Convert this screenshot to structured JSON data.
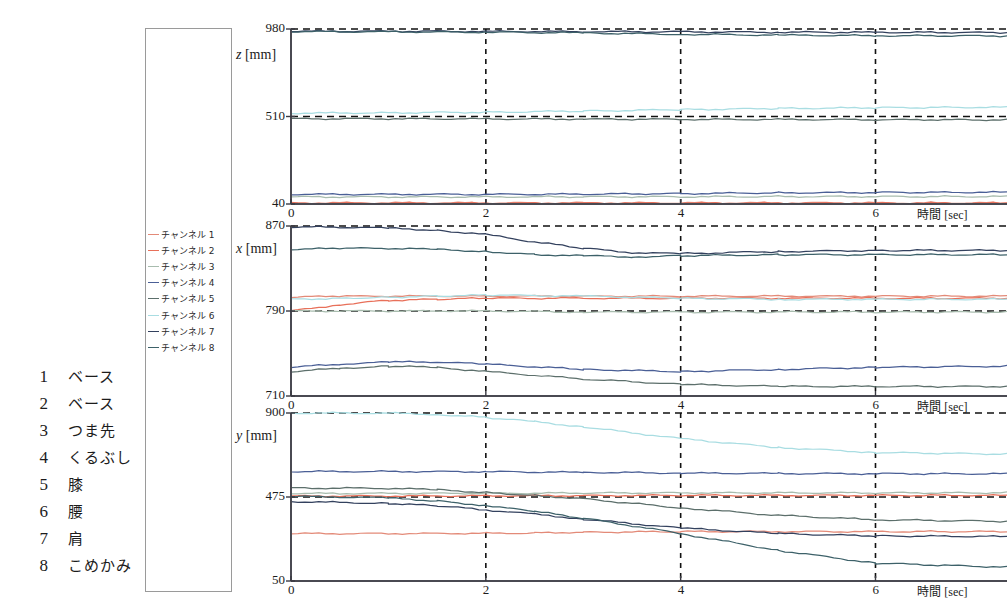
{
  "body_parts": {
    "title": "",
    "items": [
      {
        "num": "1",
        "label": "ベース"
      },
      {
        "num": "2",
        "label": "ベース"
      },
      {
        "num": "3",
        "label": "つま先"
      },
      {
        "num": "4",
        "label": "くるぶし"
      },
      {
        "num": "5",
        "label": "膝"
      },
      {
        "num": "6",
        "label": "腰"
      },
      {
        "num": "7",
        "label": "肩"
      },
      {
        "num": "8",
        "label": "こめかみ"
      }
    ]
  },
  "legend": {
    "entries": [
      {
        "label": "チャンネル 1",
        "color": "#e38a78"
      },
      {
        "label": "チャンネル 2",
        "color": "#e8705a"
      },
      {
        "label": "チャンネル 3",
        "color": "#a8bcae"
      },
      {
        "label": "チャンネル 4",
        "color": "#4a5f96"
      },
      {
        "label": "チャンネル 5",
        "color": "#5c6f6b"
      },
      {
        "label": "チャンネル 6",
        "color": "#a9dde2"
      },
      {
        "label": "チャンネル 7",
        "color": "#33415e"
      },
      {
        "label": "チャンネル 8",
        "color": "#3d6169"
      }
    ]
  },
  "chart_data": [
    {
      "id": "z-chart",
      "type": "line",
      "title": "",
      "ylabel": "z [mm]",
      "ylabel_sym": "z",
      "ylabel_unit": "[mm]",
      "xlabel_jp": "時間",
      "xlabel_unit": "[sec]",
      "xlim": [
        0,
        7.35
      ],
      "ylim": [
        40,
        980
      ],
      "yticks": [
        40,
        510,
        980
      ],
      "xticks": [
        0,
        2,
        4,
        6
      ],
      "grid": "dashed",
      "series": [
        {
          "name": "チャンネル 1",
          "color": "#e38a78",
          "x": [
            0,
            1,
            2,
            3,
            4,
            5,
            6,
            7.35
          ],
          "values": [
            46,
            46,
            46,
            46,
            46,
            46,
            46,
            46
          ]
        },
        {
          "name": "チャンネル 2",
          "color": "#e8705a",
          "x": [
            0,
            1,
            2,
            3,
            4,
            5,
            6,
            7.35
          ],
          "values": [
            44,
            44,
            44,
            44,
            44,
            44,
            44,
            44
          ]
        },
        {
          "name": "チャンネル 3",
          "color": "#a8bcae",
          "x": [
            0,
            1,
            2,
            3,
            4,
            5,
            6,
            7.35
          ],
          "values": [
            78,
            78,
            78,
            79,
            79,
            80,
            80,
            80
          ]
        },
        {
          "name": "チャンネル 4",
          "color": "#4a5f96",
          "x": [
            0,
            1,
            2,
            3,
            4,
            5,
            6,
            7.35
          ],
          "values": [
            92,
            92,
            92,
            93,
            96,
            100,
            102,
            103
          ]
        },
        {
          "name": "チャンネル 5",
          "color": "#5c6f6b",
          "x": [
            0,
            1,
            2,
            3,
            4,
            5,
            6,
            7.35
          ],
          "values": [
            498,
            498,
            497,
            496,
            495,
            494,
            493,
            492
          ]
        },
        {
          "name": "チャンネル 6",
          "color": "#a9dde2",
          "x": [
            0,
            1,
            2,
            3,
            4,
            5,
            6,
            7.35
          ],
          "values": [
            528,
            530,
            533,
            539,
            547,
            553,
            557,
            560
          ]
        },
        {
          "name": "チャンネル 7",
          "color": "#33415e",
          "x": [
            0,
            1,
            2,
            3,
            4,
            5,
            6,
            7.35
          ],
          "values": [
            968,
            968,
            967,
            966,
            965,
            963,
            962,
            961
          ]
        },
        {
          "name": "チャンネル 8",
          "color": "#3d6169",
          "x": [
            0,
            1,
            2,
            3,
            4,
            5,
            6,
            7.35
          ],
          "values": [
            966,
            965,
            963,
            959,
            952,
            947,
            944,
            943
          ]
        }
      ]
    },
    {
      "id": "x-chart",
      "type": "line",
      "title": "",
      "ylabel": "x [mm]",
      "ylabel_sym": "x",
      "ylabel_unit": "[mm]",
      "xlabel_jp": "時間",
      "xlabel_unit": "[sec]",
      "xlim": [
        0,
        7.35
      ],
      "ylim": [
        710,
        870
      ],
      "yticks": [
        710,
        790,
        870
      ],
      "xticks": [
        0,
        2,
        4,
        6
      ],
      "grid": "dashed",
      "series": [
        {
          "name": "チャンネル 1",
          "color": "#e38a78",
          "x": [
            0,
            0.5,
            1,
            1.5,
            2,
            3,
            4,
            5,
            6,
            7.35
          ],
          "values": [
            803,
            804,
            804,
            804,
            804,
            804,
            804,
            804,
            804,
            804
          ]
        },
        {
          "name": "チャンネル 2",
          "color": "#e8705a",
          "x": [
            0,
            0.5,
            1,
            1.5,
            2,
            3,
            4,
            5,
            6,
            7.35
          ],
          "values": [
            790,
            796,
            800,
            801,
            802,
            802,
            802,
            802,
            802,
            802
          ]
        },
        {
          "name": "チャンネル 3",
          "color": "#a8bcae",
          "x": [
            0,
            1,
            2,
            3,
            4,
            5,
            6,
            7.35
          ],
          "values": [
            790,
            790,
            790,
            789,
            789,
            789,
            789,
            789
          ]
        },
        {
          "name": "チャンネル 4",
          "color": "#4a5f96",
          "x": [
            0,
            0.5,
            1,
            1.5,
            2,
            3,
            4,
            5,
            6,
            7.35
          ],
          "values": [
            737,
            740,
            742,
            742,
            740,
            735,
            733,
            735,
            737,
            738
          ]
        },
        {
          "name": "チャンネル 5",
          "color": "#5c6f6b",
          "x": [
            0,
            0.5,
            1,
            1.5,
            2,
            3,
            4,
            5,
            6,
            7.35
          ],
          "values": [
            733,
            736,
            738,
            737,
            733,
            726,
            721,
            719,
            719,
            719
          ]
        },
        {
          "name": "チャンネル 6",
          "color": "#a9dde2",
          "x": [
            0,
            0.5,
            1,
            1.5,
            2,
            3,
            4,
            5,
            6,
            7.35
          ],
          "values": [
            801,
            802,
            803,
            804,
            805,
            804,
            802,
            801,
            801,
            801
          ]
        },
        {
          "name": "チャンネル 7",
          "color": "#33415e",
          "x": [
            0,
            0.5,
            1,
            1.5,
            2,
            2.5,
            3,
            3.5,
            4,
            5,
            6,
            7.35
          ],
          "values": [
            869,
            869,
            868,
            866,
            862,
            855,
            849,
            845,
            844,
            846,
            847,
            847
          ]
        },
        {
          "name": "チャンネル 8",
          "color": "#3d6169",
          "x": [
            0,
            0.5,
            1,
            1.5,
            2,
            2.5,
            3,
            3.5,
            4,
            5,
            6,
            7.35
          ],
          "values": [
            848,
            849,
            849,
            848,
            846,
            843,
            842,
            841,
            842,
            843,
            843,
            843
          ]
        }
      ]
    },
    {
      "id": "y-chart",
      "type": "line",
      "title": "",
      "ylabel": "y [mm]",
      "ylabel_sym": "y",
      "ylabel_unit": "[mm]",
      "xlabel_jp": "時間",
      "xlabel_unit": "[sec]",
      "xlim": [
        0,
        7.35
      ],
      "ylim": [
        50,
        900
      ],
      "yticks": [
        50,
        475,
        900
      ],
      "xticks": [
        0,
        2,
        4,
        6
      ],
      "grid": "dashed",
      "series": [
        {
          "name": "チャンネル 1",
          "color": "#e38a78",
          "x": [
            0,
            1,
            2,
            2.5,
            3,
            4,
            5,
            6,
            7.35
          ],
          "values": [
            290,
            290,
            291,
            293,
            297,
            300,
            300,
            300,
            300
          ]
        },
        {
          "name": "チャンネル 2",
          "color": "#e8705a",
          "x": [
            0,
            1,
            2,
            3,
            4,
            5,
            6,
            7.35
          ],
          "values": [
            480,
            480,
            481,
            482,
            483,
            483,
            483,
            483
          ]
        },
        {
          "name": "チャンネル 3",
          "color": "#a8bcae",
          "x": [
            0,
            1,
            2,
            3,
            4,
            5,
            6,
            7.35
          ],
          "values": [
            493,
            493,
            494,
            495,
            496,
            496,
            496,
            496
          ]
        },
        {
          "name": "チャンネル 4",
          "color": "#4a5f96",
          "x": [
            0,
            1,
            2,
            3,
            4,
            5,
            6,
            7.35
          ],
          "values": [
            604,
            604,
            603,
            600,
            596,
            594,
            593,
            592
          ]
        },
        {
          "name": "チャンネル 5",
          "color": "#5c6f6b",
          "x": [
            0,
            0.5,
            1,
            1.5,
            2,
            2.5,
            3,
            4,
            5,
            6,
            7.35
          ],
          "values": [
            520,
            520,
            519,
            512,
            498,
            483,
            466,
            420,
            382,
            360,
            352
          ]
        },
        {
          "name": "チャンネル 6",
          "color": "#a9dde2",
          "x": [
            0,
            1,
            1.5,
            2,
            2.5,
            3,
            4,
            5,
            6,
            7.35
          ],
          "values": [
            900,
            899,
            893,
            878,
            856,
            830,
            770,
            726,
            700,
            692
          ]
        },
        {
          "name": "チャンネル 7",
          "color": "#33415e",
          "x": [
            0,
            1,
            1.5,
            2,
            2.5,
            3,
            4,
            5,
            6,
            7.35
          ],
          "values": [
            452,
            443,
            430,
            410,
            388,
            363,
            318,
            290,
            278,
            275
          ]
        },
        {
          "name": "チャンネル 8",
          "color": "#3d6169",
          "x": [
            0,
            0.5,
            1,
            1.5,
            2,
            2.5,
            3,
            3.5,
            4,
            5,
            6,
            7.35
          ],
          "values": [
            478,
            476,
            470,
            455,
            432,
            402,
            368,
            330,
            290,
            205,
            140,
            120
          ]
        }
      ]
    }
  ]
}
